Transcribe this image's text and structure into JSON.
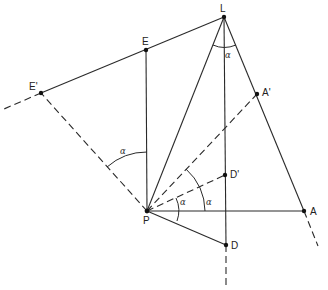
{
  "diagram": {
    "title": "",
    "stroke_color": "#2a2a2a",
    "points": {
      "L": {
        "label": "L",
        "x": 224,
        "y": 17
      },
      "E": {
        "label": "E",
        "x": 146,
        "y": 50
      },
      "E_prime": {
        "label": "E'",
        "x": 41,
        "y": 93
      },
      "A_prime": {
        "label": "A'",
        "x": 257,
        "y": 94
      },
      "D_prime": {
        "label": "D'",
        "x": 225,
        "y": 175
      },
      "P": {
        "label": "P",
        "x": 147,
        "y": 211
      },
      "A": {
        "label": "A",
        "x": 304,
        "y": 211
      },
      "D": {
        "label": "D",
        "x": 226,
        "y": 245
      }
    },
    "angle_labels": {
      "at_L": "α",
      "at_P_upper": "α",
      "at_P_outer": "α",
      "at_P_inner": "α"
    },
    "segments": [
      {
        "from": "L",
        "to": "E'",
        "style": "solid"
      },
      {
        "from": "E'",
        "to": "left-edge",
        "style": "dashed"
      },
      {
        "from": "E",
        "to": "P",
        "style": "solid"
      },
      {
        "from": "L",
        "to": "P",
        "style": "solid"
      },
      {
        "from": "L",
        "to": "D",
        "style": "solid"
      },
      {
        "from": "D",
        "to": "bottom",
        "style": "dashed"
      },
      {
        "from": "L",
        "to": "A",
        "style": "solid"
      },
      {
        "from": "A",
        "to": "beyond",
        "style": "dashed"
      },
      {
        "from": "P",
        "to": "A",
        "style": "solid"
      },
      {
        "from": "P",
        "to": "D",
        "style": "solid"
      },
      {
        "from": "P",
        "to": "E'",
        "style": "dashed"
      },
      {
        "from": "P",
        "to": "A'",
        "style": "dashed"
      },
      {
        "from": "P",
        "to": "D'",
        "style": "dashed"
      }
    ]
  }
}
